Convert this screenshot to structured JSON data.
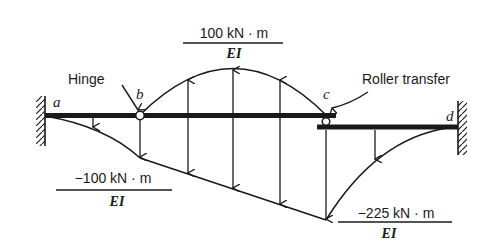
{
  "figure": {
    "type": "conjugate-beam diagram",
    "colors": {
      "ink": "#1a1a1a",
      "background": "#ffffff"
    }
  },
  "points": {
    "a": "a",
    "b": "b",
    "c": "c",
    "d": "d"
  },
  "annotations": {
    "hinge": "Hinge",
    "roller": "Roller transfer"
  },
  "moments": {
    "top": {
      "numerator": "100 kN · m",
      "denominator": "EI",
      "value": 100
    },
    "left": {
      "numerator": "−100 kN · m",
      "denominator": "EI",
      "value": -100
    },
    "right": {
      "numerator": "−225 kN · m",
      "denominator": "EI",
      "value": -225
    }
  }
}
